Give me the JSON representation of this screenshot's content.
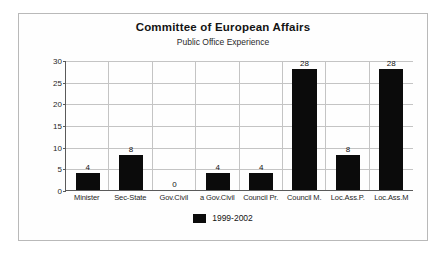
{
  "chart_data": {
    "type": "bar",
    "title": "Committee of European Affairs",
    "subtitle": "Public Office Experience",
    "xlabel": "",
    "ylabel": "",
    "ylim": [
      0,
      30
    ],
    "ytick_step": 5,
    "yticks": [
      0,
      5,
      10,
      15,
      20,
      25,
      30
    ],
    "grid": true,
    "legend_position": "bottom",
    "categories": [
      "Minister",
      "Sec-State",
      "Gov.Civil",
      "a Gov.Civil",
      "Council Pr.",
      "Council M.",
      "Loc.Ass.P.",
      "Loc.Ass.M"
    ],
    "series": [
      {
        "name": "1999-2002",
        "color": "#0b0b0b",
        "values": [
          4,
          8,
          0,
          4,
          4,
          28,
          8,
          28
        ]
      }
    ],
    "data_labels": [
      "4",
      "8",
      "0",
      "4",
      "4",
      "28",
      "8",
      "28"
    ]
  },
  "legend": {
    "entries": [
      {
        "label": "1999-2002",
        "color": "#0b0b0b"
      }
    ]
  }
}
